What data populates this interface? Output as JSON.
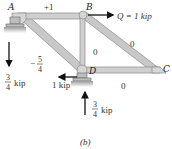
{
  "figure": {
    "caption": "(b)",
    "joints": {
      "A": "A",
      "B": "B",
      "C": "C",
      "D": "D"
    },
    "member_forces": {
      "AB": "+1",
      "AD_sign": "−",
      "AD_num": "5",
      "AD_den": "4",
      "BD": "0",
      "BC": "0",
      "DC": "0"
    },
    "loads": {
      "Q_label": "Q = 1 kip",
      "D_horizontal": "1 kip",
      "A_reaction_num": "3",
      "A_reaction_den": "4",
      "A_reaction_unit": "kip",
      "D_reaction_num": "3",
      "D_reaction_den": "4",
      "D_reaction_unit": "kip"
    },
    "colors": {
      "member_fill": "#c8c8c8",
      "member_edge": "#8a8a8a",
      "support_fill": "#bdbdbd",
      "arrow": "#111111"
    }
  }
}
